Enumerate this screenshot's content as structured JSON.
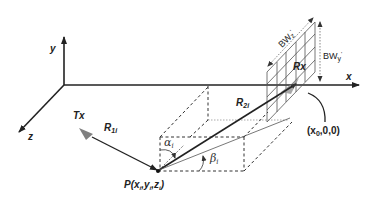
{
  "diagram": {
    "type": "3d-geometry-schematic",
    "axes": {
      "x_label": "x",
      "y_label": "y",
      "z_label": "z"
    },
    "transmitter": {
      "label": "Tx",
      "icon": "cone-icon",
      "color": "#808080"
    },
    "receiver": {
      "label": "Rx",
      "icon": "cone-icon",
      "color": "#909090"
    },
    "paths": {
      "r1_label": "R",
      "r1_sub": "1i",
      "r2_label": "R",
      "r2_sub": "2i"
    },
    "point": {
      "label_prefix": "P(",
      "x": "x",
      "x_sub": "i",
      "sep1": ",",
      "y": "y",
      "y_sub": "i",
      "sep2": ",",
      "z": "z",
      "z_sub": "i",
      "label_suffix": ")"
    },
    "angles": {
      "alpha": "α",
      "alpha_sub": "i",
      "beta": "β",
      "beta_sub": "i"
    },
    "beamwidth": {
      "z_label": "BW",
      "z_sub": "z",
      "z_prime": "'",
      "y_label": "BW",
      "y_sub": "y",
      "y_prime": "'"
    },
    "rx_position_label": "(x",
    "rx_position_sub": "0",
    "rx_position_rest": ",0,0)"
  }
}
